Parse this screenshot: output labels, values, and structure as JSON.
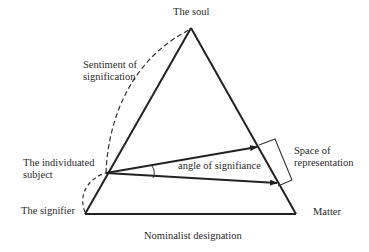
{
  "diagram": {
    "type": "semiotic-triangle",
    "colors": {
      "line": "#222222",
      "text": "#2a2a2a",
      "background": "#ffffff"
    },
    "labels": {
      "soul": "The soul",
      "sentiment_line1": "Sentiment of",
      "sentiment_line2": "signification",
      "subject_line1": "The individuated",
      "subject_line2": "subject",
      "signifier": "The signifier",
      "angle": "angle of signifiance",
      "space_line1": "Space of",
      "space_line2": "representation",
      "matter": "Matter",
      "nominalist": "Nominalist designation"
    },
    "nodes": [
      {
        "id": "soul",
        "label": "The soul"
      },
      {
        "id": "subject",
        "label": "The individuated subject"
      },
      {
        "id": "signifier",
        "label": "The signifier"
      },
      {
        "id": "matter",
        "label": "Matter"
      }
    ],
    "edges": [
      {
        "from": "signifier",
        "to": "soul",
        "style": "solid"
      },
      {
        "from": "soul",
        "to": "matter",
        "style": "solid"
      },
      {
        "from": "signifier",
        "to": "matter",
        "style": "solid",
        "label": "Nominalist designation"
      },
      {
        "from": "subject",
        "to": "soul",
        "style": "dashed-curve",
        "label": "Sentiment of signification"
      },
      {
        "from": "signifier",
        "to": "subject",
        "style": "dashed-curve"
      },
      {
        "from": "subject",
        "to": "soul-matter-edge-upper",
        "style": "arrow"
      },
      {
        "from": "subject",
        "to": "soul-matter-edge-lower",
        "style": "arrow"
      }
    ],
    "annotations": [
      {
        "type": "angle-arc",
        "label": "angle of signifiance"
      },
      {
        "type": "bracket",
        "label": "Space of representation"
      }
    ]
  }
}
